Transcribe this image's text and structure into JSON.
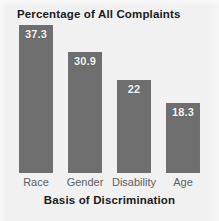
{
  "chart_data": {
    "type": "bar",
    "title": "Percentage of All Complaints",
    "xlabel": "Basis of Discrimination",
    "ylabel": "",
    "categories": [
      "Race",
      "Gender",
      "Disability",
      "Age"
    ],
    "values": [
      37.3,
      30.9,
      22,
      18.3
    ],
    "value_labels": [
      "37.3",
      "30.9",
      "22",
      "18.3"
    ],
    "grid": false,
    "legend": "none",
    "ylim": [
      0,
      37.3
    ],
    "colors": {
      "bar_fill": "#6e6e6e",
      "background": "#f1f1f1",
      "title_text": "#1b1b1b",
      "value_label_text": "#f6f6f6",
      "category_label_text": "#5f5f5f"
    }
  },
  "geometry": {
    "bars": [
      {
        "left": 19,
        "top": 25,
        "height": 148
      },
      {
        "left": 68,
        "top": 52,
        "height": 121
      },
      {
        "left": 117,
        "top": 80,
        "height": 93
      },
      {
        "left": 166,
        "top": 103,
        "height": 70
      }
    ],
    "value_label_tops": [
      28,
      55,
      83,
      106
    ],
    "category_label_left": [
      10,
      59,
      108,
      157
    ],
    "category_label_top": 176,
    "category_label_width": 52
  }
}
